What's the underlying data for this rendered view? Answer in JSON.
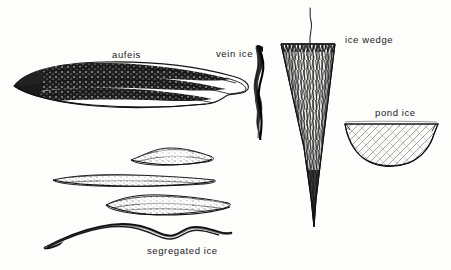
{
  "figure": {
    "kind": "line-drawing",
    "background_color": "#fdfdfc",
    "ink_color": "#1a1a1a"
  },
  "labels": {
    "aufeis": "aufeis",
    "vein_ice": "vein ice",
    "ice_wedge": "ice wedge",
    "pond_ice": "pond ice",
    "segregated_ice": "segregated ice"
  },
  "drawings": {
    "aufeis": {
      "name": "aufeis-drawing",
      "description": "elongated lens-shaped layered ice mass with dark laminated bands"
    },
    "vein_ice": {
      "name": "vein-ice-drawing",
      "description": "narrow sinuous vertical dark taper"
    },
    "ice_wedge": {
      "name": "ice-wedge-drawing",
      "description": "long downward tapering V with dense vertical hatching and thin stalk above"
    },
    "pond_ice": {
      "name": "pond-ice-drawing",
      "description": "shallow basin with flat top surface and diagonally hatched interior"
    },
    "segregated_ice": {
      "name": "segregated-ice-drawing",
      "description": "four thin undulating stacked ice lenses"
    }
  }
}
